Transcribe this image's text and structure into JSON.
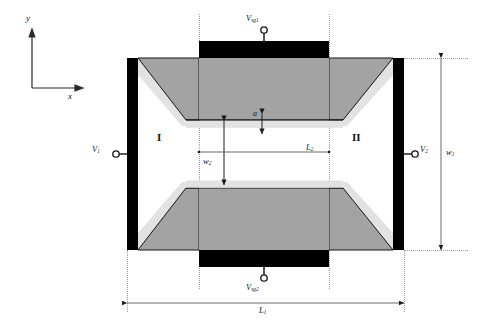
{
  "figure": {
    "type": "device-schematic",
    "axes": {
      "y_label": "y",
      "x_label": "x"
    },
    "regions": [
      {
        "id": "region-one",
        "label": "I"
      },
      {
        "id": "region-two",
        "label": "II"
      }
    ],
    "terminals": [
      {
        "id": "v1",
        "label": "V",
        "sub": "1",
        "position": "left"
      },
      {
        "id": "v2",
        "label": "V",
        "sub": "2",
        "position": "right"
      },
      {
        "id": "vsg1",
        "label": "V",
        "sub": "sg1",
        "position": "top"
      },
      {
        "id": "vsg2",
        "label": "V",
        "sub": "sg2",
        "position": "bottom"
      }
    ],
    "dimensions": [
      {
        "id": "w1",
        "label": "w",
        "sub": "1",
        "orientation": "vertical",
        "position": "right-outer"
      },
      {
        "id": "w2",
        "label": "w",
        "sub": "2",
        "orientation": "vertical",
        "position": "center"
      },
      {
        "id": "l1",
        "label": "L",
        "sub": "1",
        "orientation": "horizontal",
        "position": "bottom-outer"
      },
      {
        "id": "l2",
        "label": "L",
        "sub": "2",
        "orientation": "horizontal",
        "position": "center"
      },
      {
        "id": "a",
        "label": "a",
        "sub": "",
        "orientation": "vertical",
        "position": "center-gap"
      }
    ],
    "colors": {
      "electrode": "#000000",
      "body_fill": "#a3a3a3",
      "bevel_fill": "#e2e2e2",
      "construction_line": "#9a9a9a",
      "background": "#ffffff"
    }
  }
}
